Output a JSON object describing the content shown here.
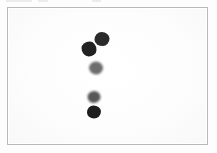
{
  "image": {
    "kind": "plate-scan",
    "width": 217,
    "height": 153,
    "background_color": "#fdfdfd",
    "alt_text": "Scanned white rectangular plate with five dark spots"
  },
  "plate": {
    "label": "specimen-plate",
    "fill_color": "#ffffff",
    "border_color": "#b9b9b9",
    "x": 7,
    "y": 7,
    "width": 201,
    "height": 138
  },
  "edge_artifacts": [
    {
      "name": "artifact-a",
      "x": 6,
      "width": 26,
      "color": "#e9e9e9"
    },
    {
      "name": "artifact-b",
      "x": 38,
      "width": 10,
      "color": "#e9e9e9"
    },
    {
      "name": "artifact-c",
      "x": 92,
      "width": 9,
      "color": "#e9e9e9"
    }
  ],
  "chart_data": {
    "type": "scatter",
    "title": "",
    "xlabel": "",
    "ylabel": "",
    "xlim": [
      0,
      217
    ],
    "ylim": [
      0,
      153
    ],
    "grid": false,
    "legend": "none",
    "note": "Five irregular dark spots on a white plate; intensity varies from mid-grey to near black.",
    "points": [
      {
        "id": 1,
        "label": "spot-1",
        "x": 101,
        "y": 38,
        "rx": 7.5,
        "ry": 7.0,
        "color": "#2a2a2a",
        "intensity": "dark",
        "blur": "soft",
        "shape": "shape-a"
      },
      {
        "id": 2,
        "label": "spot-2",
        "x": 88,
        "y": 48,
        "rx": 7.5,
        "ry": 7.5,
        "color": "#222222",
        "intensity": "very-dark",
        "blur": "soft",
        "shape": "shape-b"
      },
      {
        "id": 3,
        "label": "spot-3",
        "x": 95,
        "y": 67,
        "rx": 7.0,
        "ry": 6.5,
        "color": "#6d6d6d",
        "intensity": "mid-grey",
        "blur": "med",
        "shape": "shape-c"
      },
      {
        "id": 4,
        "label": "spot-4",
        "x": 93,
        "y": 96,
        "rx": 6.5,
        "ry": 6.0,
        "color": "#575757",
        "intensity": "medium-dark",
        "blur": "med",
        "shape": "shape-d"
      },
      {
        "id": 5,
        "label": "spot-5",
        "x": 93,
        "y": 111,
        "rx": 7.0,
        "ry": 6.5,
        "color": "#1e1e1e",
        "intensity": "very-dark",
        "blur": "soft",
        "shape": "shape-e"
      }
    ]
  }
}
